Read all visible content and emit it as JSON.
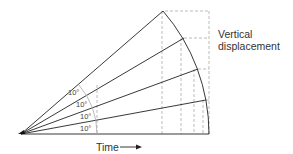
{
  "diagram": {
    "title_label": {
      "line1": "Vertical",
      "line2": "displacement"
    },
    "axis_label": "Time",
    "angles": [
      "10°",
      "10°",
      "10°",
      "10°"
    ],
    "colors": {
      "line": "#222222",
      "dashed": "#aaaaaa",
      "text": "#333333"
    }
  }
}
